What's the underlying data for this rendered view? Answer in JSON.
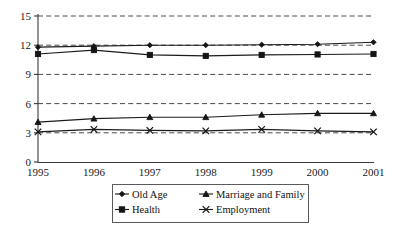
{
  "chart_data": {
    "type": "line",
    "title": "",
    "subtitle": "",
    "xlabel": "",
    "ylabel": "",
    "categories": [
      "1995",
      "1996",
      "1997",
      "1998",
      "1999",
      "2000",
      "2001"
    ],
    "x": [
      1995,
      1996,
      1997,
      1998,
      1999,
      2000,
      2001
    ],
    "xlim": [
      1995,
      2001
    ],
    "ylim": [
      0,
      15
    ],
    "yticks": [
      0,
      3,
      6,
      9,
      12,
      15
    ],
    "ytick_labels": [
      "0",
      "3",
      "6",
      "9",
      "12",
      "15"
    ],
    "xtick_labels": [
      "1995",
      "1996",
      "1997",
      "1998",
      "1999",
      "2000",
      "2001"
    ],
    "grid": "horizontal-dashed",
    "legend_position": "bottom",
    "legend_columns": 2,
    "series": [
      {
        "name": "Old Age",
        "marker": "diamond",
        "color": "#151515",
        "values": [
          11.8,
          11.9,
          12.0,
          12.0,
          12.05,
          12.1,
          12.3
        ]
      },
      {
        "name": "Marriage and Family",
        "marker": "triangle",
        "color": "#151515",
        "values": [
          4.1,
          4.45,
          4.6,
          4.6,
          4.85,
          5.0,
          5.0
        ]
      },
      {
        "name": "Health",
        "marker": "square",
        "color": "#151515",
        "values": [
          11.1,
          11.5,
          11.0,
          10.9,
          11.0,
          11.05,
          11.1
        ]
      },
      {
        "name": "Employment",
        "marker": "cross",
        "color": "#151515",
        "values": [
          3.1,
          3.35,
          3.25,
          3.2,
          3.35,
          3.2,
          3.1
        ]
      }
    ]
  },
  "legend": {
    "entries": [
      {
        "label": "Old Age",
        "marker": "diamond"
      },
      {
        "label": "Marriage and Family",
        "marker": "triangle"
      },
      {
        "label": "Health",
        "marker": "square"
      },
      {
        "label": "Employment",
        "marker": "cross"
      }
    ]
  },
  "colors": {
    "background": "#ffffff",
    "ink": "#151515",
    "axis": "#3a3a3a",
    "grid": "#4a4a4a",
    "legend_border": "#5a5a5a"
  }
}
